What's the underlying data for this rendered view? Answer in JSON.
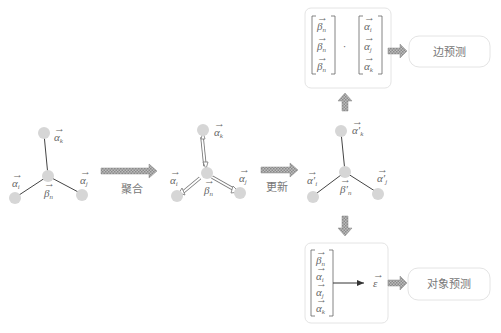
{
  "diagram": {
    "stage1": {
      "nodes": {
        "top": "α",
        "top_sub": "k",
        "left": "α",
        "left_sub": "i",
        "right": "α",
        "right_sub": "j",
        "center": "β",
        "center_sub": "n"
      }
    },
    "arrow1_label": "聚合",
    "stage2": {
      "nodes": {
        "top": "α",
        "top_sub": "k",
        "left": "α",
        "left_sub": "i",
        "right": "α",
        "right_sub": "j",
        "center": "β",
        "center_sub": "n"
      }
    },
    "arrow2_label": "更新",
    "stage3": {
      "nodes": {
        "top": "α′",
        "top_sub": "k",
        "left": "α′",
        "left_sub": "i",
        "right": "α′",
        "right_sub": "j",
        "center": "β′",
        "center_sub": "n"
      }
    },
    "edge_box": {
      "left_vector": [
        {
          "sym": "β",
          "sub": "n"
        },
        {
          "sym": "β",
          "sub": "n"
        },
        {
          "sym": "β",
          "sub": "n"
        }
      ],
      "operator": "·",
      "right_vector": [
        {
          "sym": "α",
          "sub": "i"
        },
        {
          "sym": "α",
          "sub": "j"
        },
        {
          "sym": "α",
          "sub": "k"
        }
      ]
    },
    "edge_prediction_label": "边预测",
    "object_box": {
      "vector": [
        {
          "sym": "β",
          "sub": "n"
        },
        {
          "sym": "α",
          "sub": "i"
        },
        {
          "sym": "α",
          "sub": "j"
        },
        {
          "sym": "α",
          "sub": "k"
        }
      ],
      "output": "ε"
    },
    "object_prediction_label": "对象预测",
    "colors": {
      "node": "#d6d6d6",
      "edge": "#444444",
      "arrow_fill": "#9a9a9a",
      "box_border": "#e4e4e4"
    }
  }
}
